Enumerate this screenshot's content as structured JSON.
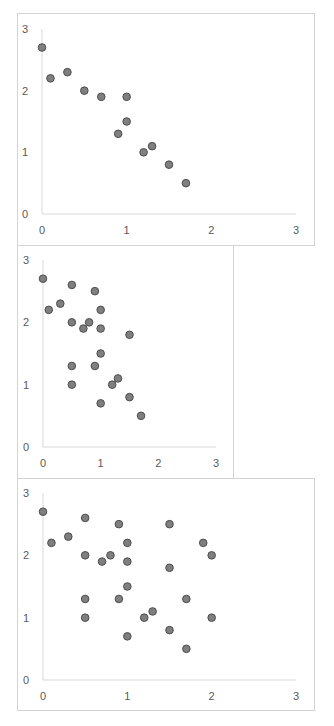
{
  "colors": {
    "marker_fill": "#7f7f7f",
    "marker_stroke": "#4d4d4d",
    "axis": "#d9d9d9",
    "tick_text": "#595959",
    "frame": "#d4d4d4"
  },
  "chart_data": [
    {
      "type": "scatter",
      "title": "",
      "xlabel": "",
      "ylabel": "",
      "xlim": [
        0,
        3
      ],
      "ylim": [
        0,
        3
      ],
      "x_ticks": [
        "0",
        "1",
        "2",
        "3"
      ],
      "y_ticks": [
        "0",
        "1",
        "2",
        "3"
      ],
      "grid": false,
      "legend": null,
      "frame": {
        "left": 17,
        "top": 13,
        "width": 298,
        "height": 233
      },
      "plot": {
        "x0": 42,
        "x3": 296,
        "y0": 214,
        "y3": 29
      },
      "points": [
        {
          "x": 0.0,
          "y": 2.7
        },
        {
          "x": 0.1,
          "y": 2.2
        },
        {
          "x": 0.3,
          "y": 2.3
        },
        {
          "x": 0.5,
          "y": 2.0
        },
        {
          "x": 0.7,
          "y": 1.9
        },
        {
          "x": 1.0,
          "y": 1.9
        },
        {
          "x": 1.0,
          "y": 1.5
        },
        {
          "x": 0.9,
          "y": 1.3
        },
        {
          "x": 1.2,
          "y": 1.0
        },
        {
          "x": 1.3,
          "y": 1.1
        },
        {
          "x": 1.5,
          "y": 0.8
        },
        {
          "x": 1.7,
          "y": 0.5
        }
      ]
    },
    {
      "type": "scatter",
      "title": "",
      "xlabel": "",
      "ylabel": "",
      "xlim": [
        0,
        3
      ],
      "ylim": [
        0,
        3
      ],
      "x_ticks": [
        "0",
        "1",
        "2",
        "3"
      ],
      "y_ticks": [
        "0",
        "1",
        "2",
        "3"
      ],
      "grid": false,
      "legend": null,
      "frame": {
        "left": 17,
        "top": 245,
        "width": 217,
        "height": 234
      },
      "plot": {
        "x0": 43,
        "x3": 216,
        "y0": 447,
        "y3": 260
      },
      "points": [
        {
          "x": 0.0,
          "y": 2.7
        },
        {
          "x": 0.1,
          "y": 2.2
        },
        {
          "x": 0.3,
          "y": 2.3
        },
        {
          "x": 0.5,
          "y": 2.6
        },
        {
          "x": 0.5,
          "y": 2.0
        },
        {
          "x": 0.5,
          "y": 1.3
        },
        {
          "x": 0.5,
          "y": 1.0
        },
        {
          "x": 0.7,
          "y": 1.9
        },
        {
          "x": 0.8,
          "y": 2.0
        },
        {
          "x": 0.9,
          "y": 2.5
        },
        {
          "x": 0.9,
          "y": 1.3
        },
        {
          "x": 1.0,
          "y": 2.2
        },
        {
          "x": 1.0,
          "y": 1.9
        },
        {
          "x": 1.0,
          "y": 1.5
        },
        {
          "x": 1.0,
          "y": 0.7
        },
        {
          "x": 1.2,
          "y": 1.0
        },
        {
          "x": 1.3,
          "y": 1.1
        },
        {
          "x": 1.5,
          "y": 1.8
        },
        {
          "x": 1.5,
          "y": 0.8
        },
        {
          "x": 1.7,
          "y": 0.5
        }
      ]
    },
    {
      "type": "scatter",
      "title": "",
      "xlabel": "",
      "ylabel": "",
      "xlim": [
        0,
        3
      ],
      "ylim": [
        0,
        3
      ],
      "x_ticks": [
        "0",
        "1",
        "2",
        "3"
      ],
      "y_ticks": [
        "0",
        "1",
        "2",
        "3"
      ],
      "grid": false,
      "legend": null,
      "frame": {
        "left": 17,
        "top": 478,
        "width": 298,
        "height": 233
      },
      "plot": {
        "x0": 43,
        "x3": 296,
        "y0": 680,
        "y3": 493
      },
      "points": [
        {
          "x": 0.0,
          "y": 2.7
        },
        {
          "x": 0.1,
          "y": 2.2
        },
        {
          "x": 0.3,
          "y": 2.3
        },
        {
          "x": 0.5,
          "y": 2.6
        },
        {
          "x": 0.5,
          "y": 2.0
        },
        {
          "x": 0.5,
          "y": 1.3
        },
        {
          "x": 0.5,
          "y": 1.0
        },
        {
          "x": 0.7,
          "y": 1.9
        },
        {
          "x": 0.8,
          "y": 2.0
        },
        {
          "x": 0.9,
          "y": 2.5
        },
        {
          "x": 0.9,
          "y": 1.3
        },
        {
          "x": 1.0,
          "y": 2.2
        },
        {
          "x": 1.0,
          "y": 1.9
        },
        {
          "x": 1.0,
          "y": 1.5
        },
        {
          "x": 1.0,
          "y": 0.7
        },
        {
          "x": 1.2,
          "y": 1.0
        },
        {
          "x": 1.3,
          "y": 1.1
        },
        {
          "x": 1.5,
          "y": 2.5
        },
        {
          "x": 1.5,
          "y": 1.8
        },
        {
          "x": 1.5,
          "y": 0.8
        },
        {
          "x": 1.7,
          "y": 1.3
        },
        {
          "x": 1.7,
          "y": 0.5
        },
        {
          "x": 1.9,
          "y": 2.2
        },
        {
          "x": 2.0,
          "y": 2.0
        },
        {
          "x": 2.0,
          "y": 1.0
        }
      ]
    }
  ]
}
